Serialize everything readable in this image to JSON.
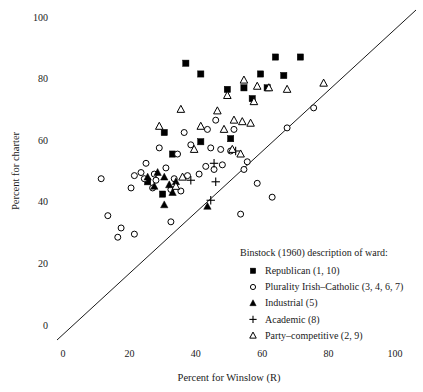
{
  "chart_data": {
    "type": "scatter",
    "title": "",
    "xlabel": "Percent for Winslow (R)",
    "ylabel": "Percent for charter",
    "xlim": [
      0,
      100
    ],
    "ylim": [
      0,
      100
    ],
    "xticks": [
      0,
      20,
      40,
      60,
      80,
      100
    ],
    "yticks": [
      0,
      20,
      40,
      60,
      80,
      100
    ],
    "grid": false,
    "legend_position": "bottom-right",
    "legend_title": "Binstock (1960) description of ward:",
    "reference_line": {
      "type": "identity",
      "from": [
        0,
        0
      ],
      "to": [
        100,
        100
      ],
      "label": "y = x"
    },
    "series": [
      {
        "name": "Republican (1, 10)",
        "marker": "filled-square",
        "points": [
          [
            37.0,
            85.0
          ],
          [
            41.5,
            81.5
          ],
          [
            64.0,
            87.0
          ],
          [
            71.5,
            87.0
          ],
          [
            59.5,
            81.5
          ],
          [
            66.5,
            81.0
          ],
          [
            54.5,
            77.0
          ],
          [
            61.5,
            77.0
          ],
          [
            49.5,
            76.5
          ],
          [
            57.0,
            73.5
          ],
          [
            30.5,
            62.5
          ],
          [
            41.5,
            59.5
          ],
          [
            33.0,
            55.5
          ],
          [
            50.5,
            60.5
          ],
          [
            25.5,
            46.5
          ],
          [
            30.0,
            42.5
          ]
        ]
      },
      {
        "name": "Plurality Irish–Catholic (3, 4, 6, 7)",
        "marker": "open-circle",
        "points": [
          [
            75.5,
            70.5
          ],
          [
            67.5,
            64.0
          ],
          [
            36.5,
            62.5
          ],
          [
            43.5,
            63.5
          ],
          [
            46.0,
            66.5
          ],
          [
            51.5,
            63.5
          ],
          [
            38.5,
            58.5
          ],
          [
            44.5,
            57.5
          ],
          [
            47.5,
            57.0
          ],
          [
            50.5,
            56.5
          ],
          [
            29.0,
            57.5
          ],
          [
            34.5,
            55.5
          ],
          [
            25.0,
            52.5
          ],
          [
            31.0,
            51.0
          ],
          [
            23.5,
            49.5
          ],
          [
            27.5,
            49.0
          ],
          [
            21.5,
            48.5
          ],
          [
            24.5,
            47.5
          ],
          [
            28.0,
            47.0
          ],
          [
            33.5,
            47.5
          ],
          [
            37.5,
            48.5
          ],
          [
            41.0,
            49.0
          ],
          [
            43.0,
            51.5
          ],
          [
            45.5,
            50.5
          ],
          [
            48.0,
            52.0
          ],
          [
            54.5,
            50.5
          ],
          [
            11.5,
            47.5
          ],
          [
            20.5,
            44.5
          ],
          [
            27.0,
            44.5
          ],
          [
            32.5,
            44.0
          ],
          [
            35.5,
            43.5
          ],
          [
            13.5,
            35.5
          ],
          [
            17.5,
            31.5
          ],
          [
            16.5,
            28.5
          ],
          [
            21.5,
            29.5
          ],
          [
            32.5,
            33.5
          ],
          [
            55.5,
            53.0
          ],
          [
            53.5,
            36.0
          ],
          [
            58.5,
            46.0
          ],
          [
            63.0,
            41.5
          ]
        ]
      },
      {
        "name": "Industrial (5)",
        "marker": "filled-triangle",
        "points": [
          [
            25.5,
            48.0
          ],
          [
            28.5,
            49.5
          ],
          [
            30.5,
            48.0
          ],
          [
            27.5,
            45.0
          ],
          [
            32.0,
            45.5
          ],
          [
            34.0,
            46.5
          ],
          [
            33.0,
            43.0
          ],
          [
            30.5,
            39.0
          ],
          [
            43.5,
            38.5
          ]
        ]
      },
      {
        "name": "Academic (8)",
        "marker": "plus",
        "points": [
          [
            38.5,
            47.0
          ],
          [
            45.5,
            52.5
          ],
          [
            46.0,
            46.5
          ],
          [
            44.5,
            40.5
          ],
          [
            52.0,
            56.5
          ]
        ]
      },
      {
        "name": "Party–competitive (2, 9)",
        "marker": "open-triangle",
        "points": [
          [
            78.5,
            78.5
          ],
          [
            54.5,
            79.5
          ],
          [
            58.5,
            77.5
          ],
          [
            62.0,
            77.0
          ],
          [
            67.5,
            76.5
          ],
          [
            49.5,
            74.5
          ],
          [
            57.5,
            72.5
          ],
          [
            35.5,
            70.0
          ],
          [
            46.5,
            69.5
          ],
          [
            51.5,
            66.5
          ],
          [
            54.0,
            66.0
          ],
          [
            56.5,
            65.5
          ],
          [
            41.5,
            64.5
          ],
          [
            48.5,
            63.5
          ],
          [
            29.0,
            64.5
          ],
          [
            39.5,
            57.0
          ],
          [
            51.0,
            57.0
          ],
          [
            53.5,
            55.5
          ],
          [
            36.0,
            48.0
          ],
          [
            34.0,
            45.0
          ]
        ]
      }
    ]
  },
  "axes": {
    "x_title": "Percent for Winslow (R)",
    "y_title": "Percent for charter",
    "x_ticks": [
      "0",
      "20",
      "40",
      "60",
      "80",
      "100"
    ],
    "y_ticks": [
      "0",
      "20",
      "40",
      "60",
      "80",
      "100"
    ]
  },
  "legend": {
    "title": "Binstock (1960) description of ward:",
    "items": [
      {
        "marker": "filled-square",
        "label": "Republican (1, 10)"
      },
      {
        "marker": "open-circle",
        "label": "Plurality Irish–Catholic (3, 4, 6, 7)"
      },
      {
        "marker": "filled-triangle",
        "label": "Industrial (5)"
      },
      {
        "marker": "plus",
        "label": "Academic (8)"
      },
      {
        "marker": "open-triangle",
        "label": "Party–competitive (2, 9)"
      }
    ]
  },
  "colors": {
    "marker": "#000000",
    "text": "#1a1a1a",
    "background": "#ffffff",
    "reference_line": "#000000"
  }
}
